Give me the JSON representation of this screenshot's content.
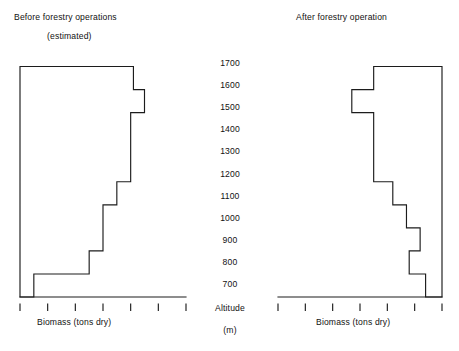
{
  "charts": {
    "before": {
      "title": "Before forestry operations",
      "subtitle": "(estimated)",
      "xlabel": "Biomass (tons dry)"
    },
    "after": {
      "title": "After forestry operation",
      "xlabel": "Biomass (tons dry)"
    }
  },
  "altitude_axis": {
    "caption": "Altitude",
    "unit": "(m)",
    "ticks": [
      "1700",
      "1600",
      "1500",
      "1400",
      "1300",
      "1200",
      "1100",
      "1000",
      "900",
      "800",
      "700"
    ]
  },
  "chart_data": [
    {
      "type": "bar",
      "orientation": "horizontal",
      "title": "Before forestry operations (estimated)",
      "xlabel": "Biomass (tons dry)",
      "ylabel": "Altitude (m)",
      "xlim": [
        0,
        60
      ],
      "x_ticks": [
        0,
        10,
        20,
        30,
        40,
        50,
        60
      ],
      "x_direction": "left-to-right",
      "ylim": [
        700,
        1700
      ],
      "y_ticks": [
        700,
        800,
        900,
        1000,
        1100,
        1200,
        1300,
        1400,
        1500,
        1600,
        1700
      ],
      "grid": false,
      "legend": "none",
      "bands": [
        {
          "altitude_from": 1600,
          "altitude_to": 1700,
          "value": 41
        },
        {
          "altitude_from": 1500,
          "altitude_to": 1600,
          "value": 45
        },
        {
          "altitude_from": 1400,
          "altitude_to": 1500,
          "value": 40
        },
        {
          "altitude_from": 1300,
          "altitude_to": 1400,
          "value": 40
        },
        {
          "altitude_from": 1200,
          "altitude_to": 1300,
          "value": 40
        },
        {
          "altitude_from": 1100,
          "altitude_to": 1200,
          "value": 35
        },
        {
          "altitude_from": 1000,
          "altitude_to": 1100,
          "value": 30
        },
        {
          "altitude_from": 900,
          "altitude_to": 1000,
          "value": 30
        },
        {
          "altitude_from": 800,
          "altitude_to": 900,
          "value": 25
        },
        {
          "altitude_from": 700,
          "altitude_to": 800,
          "value": 5
        }
      ]
    },
    {
      "type": "bar",
      "orientation": "horizontal",
      "title": "After forestry operation",
      "xlabel": "Biomass (tons dry)",
      "ylabel": "Altitude (m)",
      "xlim": [
        0,
        60
      ],
      "x_ticks": [
        60,
        50,
        40,
        30,
        20,
        10,
        0
      ],
      "x_direction": "right-to-left",
      "ylim": [
        700,
        1700
      ],
      "y_ticks": [
        700,
        800,
        900,
        1000,
        1100,
        1200,
        1300,
        1400,
        1500,
        1600,
        1700
      ],
      "grid": false,
      "legend": "none",
      "bands": [
        {
          "altitude_from": 1600,
          "altitude_to": 1700,
          "value": 25
        },
        {
          "altitude_from": 1500,
          "altitude_to": 1600,
          "value": 33
        },
        {
          "altitude_from": 1400,
          "altitude_to": 1500,
          "value": 25
        },
        {
          "altitude_from": 1300,
          "altitude_to": 1400,
          "value": 25
        },
        {
          "altitude_from": 1200,
          "altitude_to": 1300,
          "value": 25
        },
        {
          "altitude_from": 1100,
          "altitude_to": 1200,
          "value": 18
        },
        {
          "altitude_from": 1000,
          "altitude_to": 1100,
          "value": 13
        },
        {
          "altitude_from": 900,
          "altitude_to": 1000,
          "value": 8
        },
        {
          "altitude_from": 800,
          "altitude_to": 900,
          "value": 12
        },
        {
          "altitude_from": 700,
          "altitude_to": 800,
          "value": 6
        }
      ]
    }
  ]
}
